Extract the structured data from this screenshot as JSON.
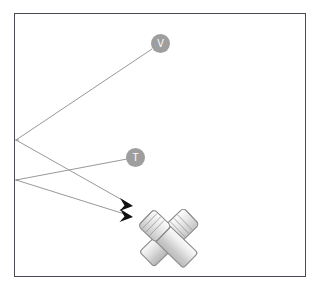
{
  "figure": {
    "background_color": "#ffffff",
    "frame": {
      "border_color": "#4a4a52",
      "fill_color": "#ffffff",
      "x": 14,
      "y": 13,
      "width": 292,
      "height": 264
    }
  },
  "nodes": [
    {
      "id": "v",
      "label": "V",
      "cx": 160,
      "cy": 44,
      "r": 9.5,
      "fill": "#9e9e9e",
      "text_color": "#ffffff"
    },
    {
      "id": "t",
      "label": "T",
      "cx": 135,
      "cy": 158,
      "r": 9.5,
      "fill": "#9e9e9e",
      "text_color": "#ffffff"
    }
  ],
  "vertices": [
    {
      "id": "upper-vertex",
      "x": 16,
      "y": 140
    },
    {
      "id": "lower-vertex",
      "x": 16,
      "y": 180
    }
  ],
  "edges": [
    {
      "id": "edge-upper-to-v",
      "from": "upper-vertex",
      "to": "node-v",
      "x1": 16,
      "y1": 140,
      "x2": 152,
      "y2": 49,
      "stroke": "#8d8d8d",
      "width": 0.9,
      "arrow": false
    },
    {
      "id": "edge-upper-to-target",
      "from": "upper-vertex",
      "to": "arrow-upper",
      "x1": 16,
      "y1": 140,
      "x2": 128,
      "y2": 203,
      "stroke": "#8d8d8d",
      "width": 0.9,
      "arrow": true
    },
    {
      "id": "edge-lower-to-t",
      "from": "lower-vertex",
      "to": "node-t",
      "x1": 16,
      "y1": 180,
      "x2": 127,
      "y2": 159,
      "stroke": "#8d8d8d",
      "width": 0.9,
      "arrow": false
    },
    {
      "id": "edge-lower-to-target",
      "from": "lower-vertex",
      "to": "arrow-lower",
      "x1": 16,
      "y1": 180,
      "x2": 128,
      "y2": 214,
      "stroke": "#8d8d8d",
      "width": 0.9,
      "arrow": true
    }
  ],
  "arrowheads": [
    {
      "id": "arrow-upper",
      "tip_x": 133,
      "tip_y": 206,
      "color": "#111111"
    },
    {
      "id": "arrow-lower",
      "tip_x": 133,
      "tip_y": 217,
      "color": "#111111"
    }
  ],
  "object_graphic": {
    "name": "crossed-cylinders",
    "description": "Two crossed cylindrical tools forming an X",
    "outline_color": "#8a8a8a",
    "fill_light": "#f2f2f2",
    "fill_mid": "#d8d8d8",
    "fill_shadow": "#bdbdbd",
    "center_x": 168,
    "center_y": 238
  },
  "icon_names": {
    "node_v": "node-badge-v-icon",
    "node_t": "node-badge-t-icon",
    "arrow": "arrowhead-icon",
    "object": "crossed-cylinders-icon"
  }
}
